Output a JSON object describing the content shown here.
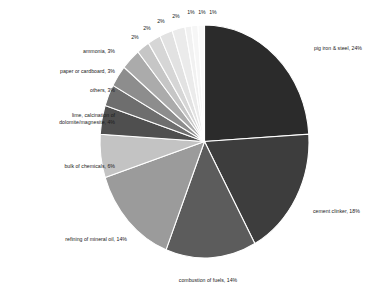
{
  "chart_data": {
    "type": "pie",
    "title": "",
    "subtitle": "",
    "xlabel": "",
    "ylabel": "",
    "legend_position": "none",
    "grid": false,
    "label_format": "{name}, {value}%",
    "start_angle_deg": 0,
    "direction": "clockwise",
    "categories": [
      "pig iron & steel",
      "cement clinker",
      "combustion of fuels",
      "refining of mineral oil",
      "bulk of chemicals",
      "lime, calcination of dolomite/magnesite",
      "others",
      "paper or cardboard",
      "ammonia",
      "",
      "",
      "",
      "",
      "",
      "",
      ""
    ],
    "values": [
      24,
      18,
      14,
      14,
      6,
      4,
      3,
      3,
      3,
      2,
      2,
      2,
      2,
      1,
      1,
      1
    ],
    "colors": [
      "#2b2b2b",
      "#3d3d3d",
      "#5c5c5c",
      "#9b9b9b",
      "#c3c3c3",
      "#4f4f4f",
      "#6e6e6e",
      "#8d8d8d",
      "#ababab",
      "#c6c6c6",
      "#d6d6d6",
      "#e2e2e2",
      "#ebebeb",
      "#f1f1f1",
      "#f6f6f6",
      "#fafafa"
    ],
    "slices": [
      {
        "name": "pig iron & steel",
        "value": 24,
        "label": "pig iron & steel, 24%",
        "color": "#2b2b2b"
      },
      {
        "name": "cement clinker",
        "value": 18,
        "label": "cement clinker, 18%",
        "color": "#3d3d3d"
      },
      {
        "name": "combustion of fuels",
        "value": 14,
        "label": "combustion of fuels, 14%",
        "color": "#5c5c5c"
      },
      {
        "name": "refining of mineral oil",
        "value": 14,
        "label": "refining of mineral oil, 14%",
        "color": "#9b9b9b"
      },
      {
        "name": "bulk of chemicals",
        "value": 6,
        "label": "bulk of chemicals, 6%",
        "color": "#c3c3c3"
      },
      {
        "name": "lime, calcination of dolomite/magnesite",
        "value": 4,
        "label": "lime, calcination of dolomite/magnesite, 4%",
        "color": "#4f4f4f"
      },
      {
        "name": "others",
        "value": 3,
        "label": "others, 3%",
        "color": "#6e6e6e"
      },
      {
        "name": "paper or cardboard",
        "value": 3,
        "label": "paper or cardboard, 3%",
        "color": "#8d8d8d"
      },
      {
        "name": "ammonia",
        "value": 3,
        "label": "ammonia, 3%",
        "color": "#ababab"
      },
      {
        "name": "",
        "value": 2,
        "label": "2%",
        "color": "#c6c6c6"
      },
      {
        "name": "",
        "value": 2,
        "label": "2%",
        "color": "#d6d6d6"
      },
      {
        "name": "",
        "value": 2,
        "label": "2%",
        "color": "#e2e2e2"
      },
      {
        "name": "",
        "value": 2,
        "label": "2%",
        "color": "#ebebeb"
      },
      {
        "name": "",
        "value": 1,
        "label": "1%",
        "color": "#f1f1f1"
      },
      {
        "name": "",
        "value": 1,
        "label": "1%",
        "color": "#f6f6f6"
      },
      {
        "name": "",
        "value": 1,
        "label": "1%",
        "color": "#fafafa"
      }
    ]
  },
  "labels": {
    "pig_iron": "pig iron & steel, 24%",
    "cement_clinker": "cement clinker, 18%",
    "combustion": "combustion of fuels, 14%",
    "refining": "refining of mineral oil, 14%",
    "bulk_chemicals": "bulk of chemicals, 6%",
    "lime_line1": "lime, calcination of",
    "lime_line2": "dolomite/magnesite, 4%",
    "others": "others, 3%",
    "paper": "paper or cardboard, 3%",
    "ammonia": "ammonia, 3%",
    "pct_2_a": "2%",
    "pct_2_b": "2%",
    "pct_2_c": "2%",
    "pct_2_d": "2%",
    "pct_1_a": "1%",
    "pct_1_b": "1%",
    "pct_1_c": "1%"
  }
}
